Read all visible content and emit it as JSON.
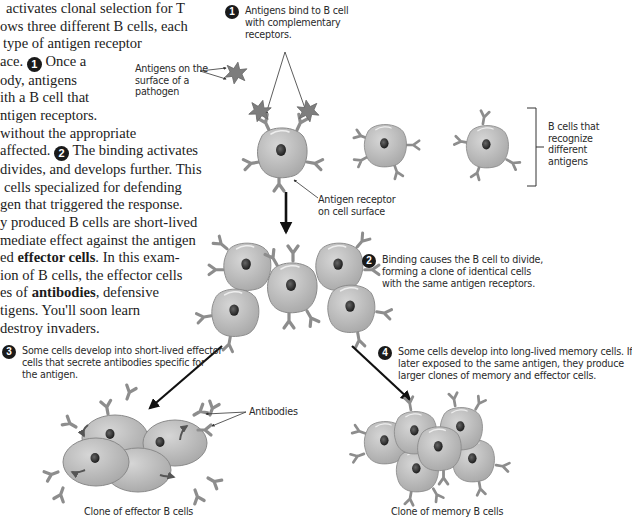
{
  "body_text": {
    "lines": [
      "activates clonal selection for T",
      "ows three different B cells, each",
      "type of antigen receptor",
      "ace.",
      "ody, antigens",
      "ith a B cell that",
      "ntigen receptors.",
      "without the appropriate",
      "affected.",
      "divides, and develops further. This",
      "cells specialized for defending",
      "gen that triggered the response.",
      "y produced B cells are short-lived",
      "mediate effect against the antigen",
      "ed",
      "ion of B cells, the effector cells",
      "es of",
      "tigens. You'll soon learn",
      "destroy invaders."
    ],
    "line3_after_num": "Once a",
    "line8_after_num": "The binding activates",
    "line14_bold": "effector cells",
    "line14_after": ". In this exam-",
    "line16_bold": "antibodies",
    "line16_after": ", defensive",
    "step_marker_1": "1",
    "step_marker_2": "2"
  },
  "figure": {
    "step1": {
      "number": "1",
      "lines": [
        "Antigens bind to B cell",
        "with complementary",
        "receptors."
      ]
    },
    "step2": {
      "number": "2",
      "lines": [
        "Binding causes the B cell to divide,",
        "forming a clone of identical cells",
        "with the same antigen receptors."
      ]
    },
    "step3": {
      "number": "3",
      "lines": [
        "Some cells develop into short-lived effector",
        "cells that secrete antibodies specific for",
        "the antigen."
      ]
    },
    "step4": {
      "number": "4",
      "lines": [
        "Some cells develop into long-lived memory cells. If",
        "later exposed to the same antigen, they produce",
        "larger clones of memory and effector cells."
      ]
    },
    "labels": {
      "antigens_pathogen": [
        "Antigens on the",
        "surface of a",
        "pathogen"
      ],
      "b_cells_recognize": [
        "B cells that",
        "recognize",
        "different",
        "antigens"
      ],
      "antigen_receptor": [
        "Antigen receptor",
        "on cell surface"
      ],
      "antibodies": "Antibodies",
      "effector_clone": "Clone of effector B cells",
      "memory_clone": "Clone of memory B cells"
    },
    "colors": {
      "cell_fill": "#b9b9b9",
      "cell_stroke": "#8a8a8a",
      "nucleus": "#3a3a3a",
      "receptor": "#8d8d8d",
      "antigen": "#7d7d7d",
      "arrow": "#111111"
    }
  }
}
